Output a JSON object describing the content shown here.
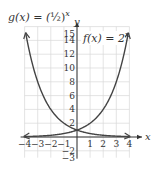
{
  "chart_data": {
    "type": "line",
    "title": "",
    "xlabel": "x",
    "ylabel": "y",
    "xlim": [
      -4,
      4
    ],
    "ylim": [
      -3,
      15
    ],
    "grid": true,
    "x_ticks": [
      -4,
      -3,
      -2,
      -1,
      1,
      2,
      3,
      4
    ],
    "y_ticks": [
      -3,
      -2,
      2,
      4,
      6,
      8,
      10,
      12,
      14,
      15
    ],
    "series": [
      {
        "name": "g(x) = (1/2)^x",
        "label_text": "g(x) = (½)^x",
        "x": [
          -4,
          -3,
          -2,
          -1,
          0,
          1,
          2,
          3,
          4
        ],
        "values": [
          16,
          8,
          4,
          2,
          1,
          0.5,
          0.25,
          0.125,
          0.0625
        ]
      },
      {
        "name": "f(x) = 2^x",
        "label_text": "f(x) = 2^x",
        "x": [
          -4,
          -3,
          -2,
          -1,
          0,
          1,
          2,
          3,
          4
        ],
        "values": [
          0.0625,
          0.125,
          0.25,
          0.5,
          1,
          2,
          4,
          8,
          16
        ]
      }
    ],
    "annotations": [
      "g(x) = (½)^x",
      "f(x) = 2^x"
    ]
  },
  "labels": {
    "g_prefix": "g(x) = (",
    "g_half": "½",
    "g_suffix": ")",
    "g_exp": "x",
    "f_prefix": "f(x) = 2",
    "f_exp": "x",
    "x_axis": "x",
    "y_axis": "y"
  },
  "colors": {
    "curve": "#444444",
    "axis": "#333333",
    "grid": "#d9d9d9"
  }
}
